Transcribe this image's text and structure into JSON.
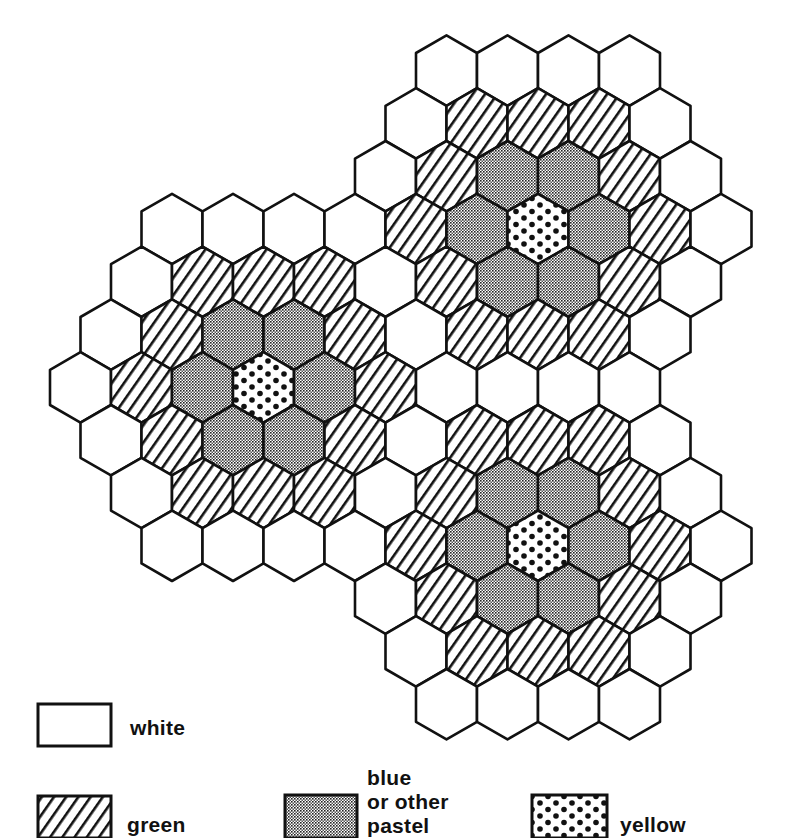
{
  "diagram": {
    "title": "",
    "grid": {
      "orientation": "pointy-top",
      "origin_px": [
        538,
        229
      ],
      "hex_width_px": 61,
      "row_spacing_px": 52.8,
      "hex_radius_px": 35.2,
      "stroke_color": "#111111",
      "stroke_width": 2.6
    },
    "clusters": [
      {
        "name": "top-right",
        "axial": [
          0,
          0
        ]
      },
      {
        "name": "left",
        "axial": [
          -6,
          3
        ]
      },
      {
        "name": "bottom-right",
        "axial": [
          -3,
          6
        ]
      }
    ],
    "rings": [
      {
        "distance": 0,
        "fill": "yellow",
        "count_per_cluster": 1
      },
      {
        "distance": 1,
        "fill": "blue",
        "count_per_cluster": 6
      },
      {
        "distance": 2,
        "fill": "green",
        "count_per_cluster": 12
      },
      {
        "distance": 3,
        "fill": "white",
        "count_per_cluster": 18
      }
    ]
  },
  "legend": {
    "items": [
      {
        "key": "white",
        "label_lines": [
          "white"
        ],
        "pattern": "plain",
        "box": [
          38,
          704,
          73,
          42
        ],
        "label_pos": [
          130,
          716
        ]
      },
      {
        "key": "green",
        "label_lines": [
          "green"
        ],
        "pattern": "diagonal-hatch",
        "box": [
          38,
          796,
          73,
          42
        ],
        "label_pos": [
          127,
          813
        ]
      },
      {
        "key": "blue",
        "label_lines": [
          "blue",
          "or other",
          "pastel"
        ],
        "pattern": "fine-dot-screen",
        "box": [
          285,
          795,
          72,
          43
        ],
        "label_pos": [
          367,
          766
        ]
      },
      {
        "key": "yellow",
        "label_lines": [
          "yellow"
        ],
        "pattern": "large-dots",
        "box": [
          532,
          795,
          75,
          43
        ],
        "label_pos": [
          620,
          813
        ]
      }
    ]
  },
  "colors": {
    "ink": "#111111",
    "paper": "#ffffff"
  }
}
